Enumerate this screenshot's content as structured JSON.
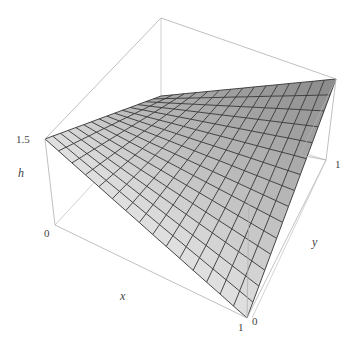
{
  "chart_data": {
    "type": "surface3d",
    "title": "",
    "xlabel": "x",
    "ylabel": "y",
    "zlabel": "h",
    "x_range": [
      0,
      1
    ],
    "y_range": [
      0,
      1
    ],
    "z_range": [
      0,
      1.5
    ],
    "tick_labels": {
      "z_top": "1.5",
      "x_origin": "0",
      "x_end": "1",
      "y_origin": "0",
      "y_end": "1"
    },
    "grid_divisions": 15,
    "surface": {
      "description": "bilinear surface h(x,y) over unit square",
      "corners": [
        {
          "x": 0,
          "y": 0,
          "h": 1.5
        },
        {
          "x": 1,
          "y": 0,
          "h": 0
        },
        {
          "x": 1,
          "y": 1,
          "h": 1.5
        },
        {
          "x": 0,
          "y": 1,
          "h": 1.0
        }
      ]
    },
    "box": true,
    "colors": {
      "surface_light": "#ececec",
      "surface_dark": "#9a9a9a",
      "mesh": "#333333",
      "box": "#b5b5b5",
      "label": "#444444"
    },
    "projection": {
      "box_top_left": [
        45,
        139
      ],
      "box_top_back": [
        161,
        18
      ],
      "box_top_right": [
        336,
        79
      ],
      "box_top_front": [
        220,
        200
      ],
      "box_bottom_left": [
        55,
        225
      ],
      "box_bottom_back": [
        161,
        110
      ],
      "box_bottom_right": [
        326,
        160
      ],
      "box_bottom_front": [
        247,
        318
      ],
      "surface_left": [
        45,
        139
      ],
      "surface_back": [
        161,
        96
      ],
      "surface_right": [
        336,
        79
      ],
      "surface_front": [
        247,
        318
      ]
    }
  },
  "labels": {
    "z_tick": "1.5",
    "z_axis": "h",
    "x_origin": "0",
    "x_axis": "x",
    "x_end": "1",
    "y_origin": "0",
    "y_axis": "y",
    "y_end": "1"
  }
}
